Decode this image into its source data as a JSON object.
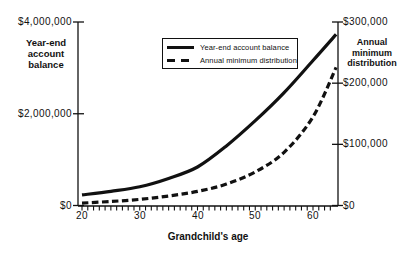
{
  "chart_data": {
    "type": "line",
    "x_axis": {
      "title": "Grandchild's age",
      "tick_labels": [
        "20",
        "30",
        "40",
        "50",
        "60"
      ],
      "tick_values": [
        20,
        30,
        40,
        50,
        60
      ],
      "minor_tick_interval": 1,
      "range": [
        19.3,
        64.7
      ]
    },
    "left_axis": {
      "title_lines": [
        "Year-end",
        "account",
        "balance"
      ],
      "range": [
        0,
        4000000
      ],
      "ticks": [
        {
          "value": 4000000,
          "label": "$4,000,000"
        },
        {
          "value": 2000000,
          "label": "$2,000,000"
        },
        {
          "value": 0,
          "label": "$0"
        }
      ]
    },
    "right_axis": {
      "title_lines": [
        "Annual",
        "minimum",
        "distribution"
      ],
      "range": [
        0,
        300000
      ],
      "ticks": [
        {
          "value": 300000,
          "label": "$300,000"
        },
        {
          "value": 200000,
          "label": "$200,000"
        },
        {
          "value": 100000,
          "label": "$100,000"
        },
        {
          "value": 0,
          "label": "$0"
        }
      ]
    },
    "x": [
      20,
      25,
      30,
      35,
      40,
      45,
      50,
      55,
      60,
      64
    ],
    "series": [
      {
        "name": "Year-end account balance",
        "axis": "left",
        "line_style": "solid",
        "values": [
          230000,
          310000,
          410000,
          590000,
          840000,
          1300000,
          1850000,
          2460000,
          3160000,
          3730000
        ]
      },
      {
        "name": "Annual minimum distribution",
        "axis": "right",
        "line_style": "dashed",
        "values": [
          4000,
          6500,
          10000,
          15500,
          23000,
          35000,
          55000,
          87000,
          145000,
          226000
        ]
      }
    ],
    "legend": [
      {
        "label": "Year-end account balance",
        "line_style": "solid"
      },
      {
        "label": "Annual minimum distribution",
        "line_style": "dashed"
      }
    ],
    "colors": {
      "line": "#111111",
      "background": "#ffffff"
    }
  }
}
